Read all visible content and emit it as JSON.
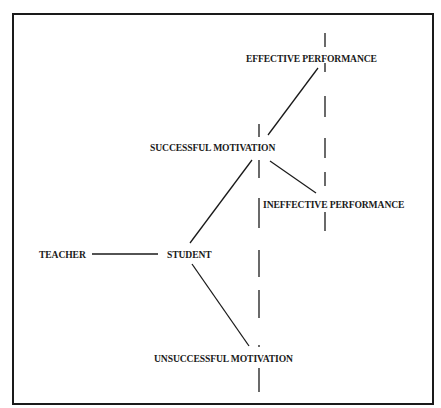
{
  "diagram": {
    "type": "tree-flow",
    "colors": {
      "ink": "#1a1a1a",
      "background": "#ffffff"
    },
    "nodes": {
      "teacher": {
        "label": "TEACHER",
        "x": 39,
        "y": 255
      },
      "student": {
        "label": "STUDENT",
        "x": 167,
        "y": 255
      },
      "successful_motivation": {
        "label": "SUCCESSFUL MOTIVATION",
        "x": 150,
        "y": 148
      },
      "unsuccessful_motivation": {
        "label": "UNSUCCESSFUL MOTIVATION",
        "x": 154,
        "y": 359
      },
      "effective_performance": {
        "label": "EFFECTIVE PERFORMANCE",
        "x": 246,
        "y": 59
      },
      "ineffective_performance": {
        "label": "INEFFECTIVE PERFORMANCE",
        "x": 263,
        "y": 205
      }
    },
    "edges": [
      {
        "from": "teacher",
        "to": "student",
        "x1": 92,
        "y1": 254,
        "x2": 158,
        "y2": 254
      },
      {
        "from": "student",
        "to": "successful_motivation",
        "x1": 190,
        "y1": 243,
        "x2": 252,
        "y2": 160
      },
      {
        "from": "student",
        "to": "unsuccessful_motivation",
        "x1": 192,
        "y1": 264,
        "x2": 249,
        "y2": 346
      },
      {
        "from": "successful_motivation",
        "to": "effective_performance",
        "x1": 268,
        "y1": 135,
        "x2": 318,
        "y2": 68
      },
      {
        "from": "successful_motivation",
        "to": "ineffective_performance",
        "x1": 270,
        "y1": 161,
        "x2": 316,
        "y2": 193
      }
    ],
    "dashed_lines": [
      {
        "name": "motivation-boundary",
        "x": 259,
        "segments": [
          [
            124,
            137
          ],
          [
            160,
            178
          ],
          [
            198,
            228
          ],
          [
            250,
            277
          ],
          [
            290,
            318
          ],
          [
            345,
            347
          ],
          [
            368,
            392
          ]
        ]
      },
      {
        "name": "performance-boundary",
        "x": 325,
        "segments": [
          [
            33,
            47
          ],
          [
            63,
            72
          ],
          [
            96,
            117
          ],
          [
            138,
            158
          ],
          [
            172,
            186
          ],
          [
            212,
            231
          ]
        ]
      }
    ]
  }
}
